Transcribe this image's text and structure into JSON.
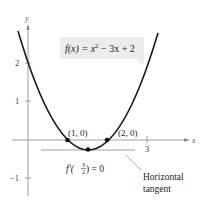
{
  "figure": {
    "function_label": "f(x) = x² − 3x + 2",
    "function_label_parts": {
      "prefix": "f(x) = x",
      "sup": "2",
      "suffix": " − 3x + 2"
    },
    "derivative_label": {
      "prefix": "f′(",
      "num": "3",
      "den": "2",
      "suffix": ") = 0"
    },
    "annotation": {
      "line1": "Horizontal",
      "line2": "tangent"
    },
    "points": [
      {
        "label": "(1, 0)",
        "x": 1,
        "y": 0
      },
      {
        "label": "(2, 0)",
        "x": 2,
        "y": 0
      },
      {
        "label": "vertex",
        "x": 1.5,
        "y": -0.25
      }
    ],
    "axes": {
      "x_label": "x",
      "y_label": "y",
      "x_ticks": [
        {
          "value": 3,
          "label": "3"
        }
      ],
      "y_ticks": [
        {
          "value": 2,
          "label": "2"
        },
        {
          "value": 1,
          "label": "1"
        },
        {
          "value": -1,
          "label": "−1"
        }
      ]
    },
    "colors": {
      "curve": "#1a1a1a",
      "axis": "#777777",
      "label_bg": "#ececec",
      "text": "#222222"
    }
  }
}
